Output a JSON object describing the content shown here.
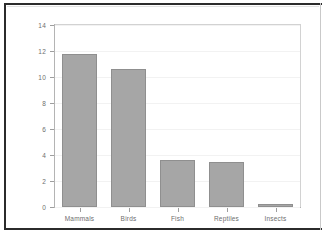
{
  "chart_data": {
    "type": "bar",
    "title": "",
    "subtitle": "",
    "xlabel": "",
    "ylabel": "",
    "categories": [
      "Mammals",
      "Birds",
      "Fish",
      "Reptiles",
      "Insects"
    ],
    "values": [
      11.75,
      10.6,
      3.65,
      3.5,
      0.2
    ],
    "series": [
      {
        "name": "",
        "values": [
          11.75,
          10.6,
          3.65,
          3.5,
          0.2
        ]
      }
    ],
    "ylim": [
      0,
      14
    ],
    "yticks": [
      0,
      2,
      4,
      6,
      8,
      10,
      12,
      14
    ],
    "ytick_labels": [
      "0",
      "2",
      "4",
      "6",
      "8",
      "10",
      "12",
      "14"
    ],
    "grid": true,
    "grid_axis": "y",
    "legend": false,
    "legend_position": "none",
    "bar_color": "#a6a6a6",
    "bar_edge_color": "#8f8f8f",
    "axis_color": "#b4b4b4",
    "grid_color": "#f2f2f2",
    "tick_label_color": "#6e6e6e",
    "background_color": "#ffffff",
    "frame_color": "#2b2b2b"
  }
}
